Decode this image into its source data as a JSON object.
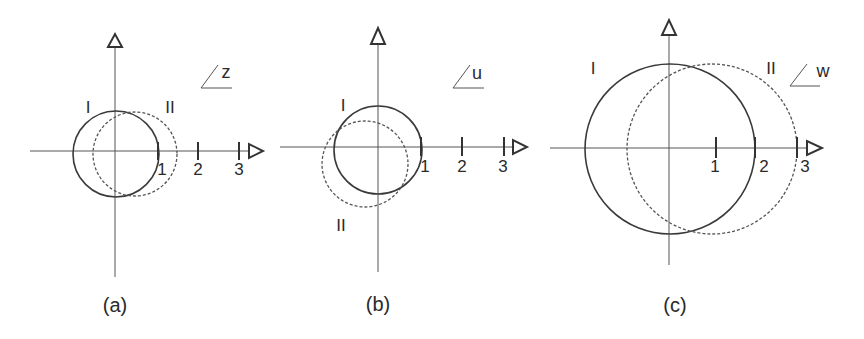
{
  "panels": [
    {
      "id": "a",
      "caption": "(a)",
      "variable": "z",
      "origin": [
        115,
        151
      ],
      "x_axis_start": 30,
      "x_axis_end": 248,
      "y_axis_top": 48,
      "y_axis_bottom": 277,
      "unit_px": 41,
      "ticks": [
        {
          "value": 1,
          "label": "1"
        },
        {
          "value": 2,
          "label": "2"
        },
        {
          "value": 3,
          "label": "3"
        }
      ],
      "curves": [
        {
          "label": "I",
          "style": "solid",
          "center": [
            116,
            154
          ],
          "radius": 43,
          "label_pos": [
            88,
            113
          ]
        },
        {
          "label": "II",
          "style": "dashed",
          "center": [
            135,
            154
          ],
          "radius": 42,
          "label_pos": [
            166,
            113
          ]
        }
      ],
      "caption_pos": [
        115,
        312
      ]
    },
    {
      "id": "b",
      "caption": "(b)",
      "variable": "u",
      "origin": [
        378,
        147
      ],
      "x_axis_start": 280,
      "x_axis_end": 512,
      "y_axis_top": 45,
      "y_axis_bottom": 272,
      "unit_px": 42,
      "ticks": [
        {
          "value": 1,
          "label": "1"
        },
        {
          "value": 2,
          "label": "2"
        },
        {
          "value": 3,
          "label": "3"
        }
      ],
      "curves": [
        {
          "label": "I",
          "style": "solid",
          "center": [
            378,
            150
          ],
          "radius": 44,
          "label_pos": [
            343,
            111
          ]
        },
        {
          "label": "II",
          "style": "dashed",
          "center": [
            365,
            164
          ],
          "radius": 43,
          "label_pos": [
            341,
            231
          ]
        }
      ],
      "caption_pos": [
        378,
        311
      ]
    },
    {
      "id": "c",
      "caption": "(c)",
      "variable": "w",
      "origin": [
        669,
        148
      ],
      "x_axis_start": 550,
      "x_axis_end": 806,
      "y_axis_top": 36,
      "y_axis_bottom": 265,
      "unit_px": 43,
      "ticks": [
        {
          "value": 1,
          "label": "1"
        },
        {
          "value": 2,
          "label": "2"
        },
        {
          "value": 3,
          "label": "3"
        }
      ],
      "curves": [
        {
          "label": "I",
          "style": "solid",
          "center": [
            670,
            149
          ],
          "radius": 85,
          "label_pos": [
            592,
            74
          ]
        },
        {
          "label": "II",
          "style": "dashed",
          "center": [
            712,
            149
          ],
          "radius": 85,
          "label_pos": [
            770,
            74
          ]
        }
      ],
      "caption_pos": [
        675,
        312
      ]
    }
  ],
  "colors": {
    "background": "#ffffff",
    "line": "#3a3a3a",
    "text": "#2a2a2a"
  }
}
